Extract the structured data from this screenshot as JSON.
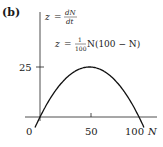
{
  "panel_label": "(b)",
  "chart_data": {
    "type": "line",
    "title": "",
    "xlabel": "N",
    "ylabel": "z = dN/dt",
    "equation": "z = (1/100) N (100 − N)",
    "x_ticks": [
      0,
      50,
      100
    ],
    "x_tick_labels": [
      "0",
      "50",
      "100"
    ],
    "y_ticks": [
      25
    ],
    "y_tick_labels": [
      "25"
    ],
    "xlim": [
      -15,
      118
    ],
    "ylim": [
      -5,
      52
    ],
    "grid": false,
    "legend": "none",
    "series": [
      {
        "name": "z = (1/100) N(100 − N)",
        "x": [
          -5,
          0,
          10,
          20,
          30,
          40,
          50,
          60,
          70,
          80,
          90,
          100,
          105
        ],
        "values": [
          -5.25,
          0,
          9,
          16,
          21,
          24,
          25,
          24,
          21,
          16,
          9,
          0,
          -5.25
        ]
      }
    ],
    "annotations": [
      {
        "text": "z = dN/dt",
        "position": "top of y-axis"
      },
      {
        "text": "z = (1/100) N(100 − N)",
        "position": "upper right of curve"
      }
    ]
  },
  "labels": {
    "z": "z",
    "eq_sign": "=",
    "dN": "dN",
    "dt": "dt",
    "one": "1",
    "hundred": "100",
    "rhs": "N(100 − N)",
    "y_tick_25": "25",
    "x_tick_0": "0",
    "x_tick_50": "50",
    "x_tick_100": "100",
    "x_axis_name": "N"
  }
}
